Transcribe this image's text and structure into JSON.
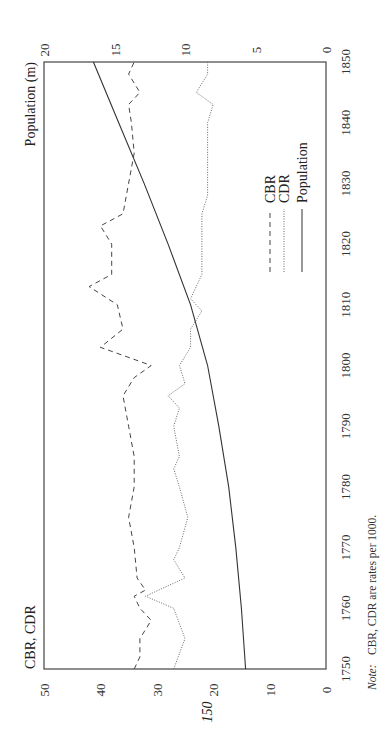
{
  "page": {
    "page_number": "150",
    "note_label": "Note:",
    "note_text": "CBR, CDR are rates per 1000."
  },
  "chart_data": {
    "type": "line",
    "orientation": "rotated 90 degrees counter-clockwise on page",
    "title": "",
    "xlabel": "",
    "ylabel_left": "CBR, CDR",
    "ylabel_right": "Population (m)",
    "x_ticks": [
      1750,
      1760,
      1770,
      1780,
      1790,
      1800,
      1810,
      1820,
      1830,
      1840,
      1850
    ],
    "y_left_ticks": [
      0,
      10,
      20,
      30,
      40,
      50
    ],
    "y_right_ticks": [
      0,
      5,
      10,
      15,
      20
    ],
    "xlim": [
      1750,
      1850
    ],
    "ylim_left": [
      0,
      50
    ],
    "ylim_right": [
      0,
      20
    ],
    "grid": false,
    "legend": {
      "position": "inside, middle-right",
      "entries": [
        {
          "label": "CBR",
          "style": "dashed"
        },
        {
          "label": "CDR",
          "style": "dotted"
        },
        {
          "label": "Population",
          "style": "solid"
        }
      ]
    },
    "series": [
      {
        "name": "CBR",
        "axis": "left",
        "style": "dashed",
        "x": [
          1750,
          1752,
          1755,
          1758,
          1760,
          1762,
          1763,
          1765,
          1770,
          1775,
          1780,
          1785,
          1790,
          1795,
          1798,
          1800,
          1803,
          1806,
          1810,
          1813,
          1815,
          1820,
          1823,
          1825,
          1830,
          1835,
          1840,
          1843,
          1845,
          1848,
          1850
        ],
        "values": [
          34,
          33,
          33,
          31,
          33,
          34,
          32,
          33.5,
          34,
          35,
          34,
          34,
          35,
          36,
          34,
          31,
          40,
          36,
          37,
          42,
          38,
          38,
          40,
          36,
          35,
          34,
          34.5,
          35,
          33,
          35,
          34
        ]
      },
      {
        "name": "CDR",
        "axis": "left",
        "style": "dotted",
        "x": [
          1750,
          1755,
          1760,
          1762,
          1765,
          1768,
          1770,
          1775,
          1780,
          1783,
          1785,
          1790,
          1793,
          1795,
          1797,
          1800,
          1803,
          1806,
          1809,
          1811,
          1815,
          1820,
          1825,
          1828,
          1830,
          1835,
          1840,
          1843,
          1845,
          1848,
          1850
        ],
        "values": [
          27,
          25,
          27,
          32,
          25,
          27,
          26,
          24.5,
          26,
          27,
          26,
          27,
          26,
          28,
          25,
          26,
          24,
          24,
          22,
          24,
          22,
          22,
          22,
          21,
          21,
          21,
          21,
          20,
          23,
          21,
          21
        ]
      },
      {
        "name": "Population",
        "axis": "right",
        "style": "solid",
        "x": [
          1750,
          1760,
          1770,
          1780,
          1790,
          1800,
          1810,
          1820,
          1830,
          1840,
          1850
        ],
        "values": [
          5.7,
          6.0,
          6.4,
          6.9,
          7.6,
          8.4,
          9.6,
          11.2,
          12.9,
          14.7,
          16.5
        ]
      }
    ]
  }
}
